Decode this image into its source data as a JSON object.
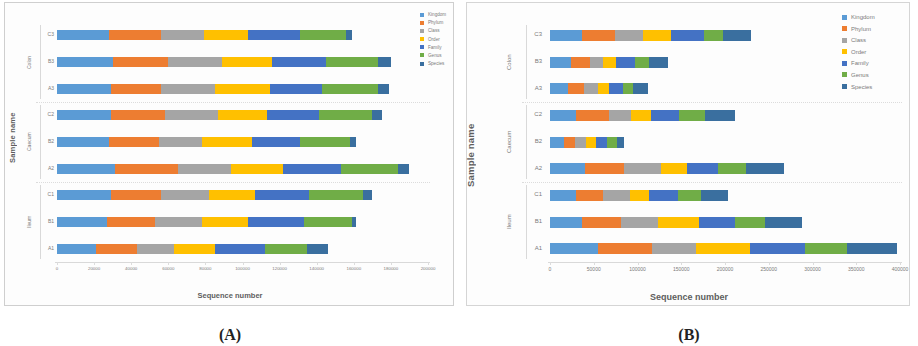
{
  "figure": {
    "panels": [
      {
        "key": "A",
        "caption": "(A)"
      },
      {
        "key": "B",
        "caption": "(B)"
      }
    ]
  },
  "series_colors": {
    "Kingdom": "#5b9bd5",
    "Phylum": "#ed7d31",
    "Class": "#a5a5a5",
    "Order": "#ffc000",
    "Family": "#4472c4",
    "Genus": "#70ad47",
    "Species": "#3a6f9f"
  },
  "legend": {
    "position": "right",
    "entries": [
      "Kingdom",
      "Phylum",
      "Class",
      "Order",
      "Family",
      "Genus",
      "Species"
    ]
  },
  "axis_titles": {
    "x": "Sequence number",
    "y": "Sample name"
  },
  "groups": [
    "Colon",
    "Caecum",
    "Ileum"
  ],
  "chart_data": [
    {
      "panel": "A",
      "caption": "(A)",
      "type": "bar",
      "orientation": "horizontal",
      "stacked": true,
      "title": "",
      "xlabel": "Sequence number",
      "ylabel": "Sample name",
      "xlim": [
        0,
        200000
      ],
      "xticks": [
        0,
        20000,
        40000,
        60000,
        80000,
        100000,
        120000,
        140000,
        160000,
        180000,
        200000
      ],
      "xticklabels": [
        "0",
        "20000",
        "40000",
        "60000",
        "80000",
        "100000",
        "120000",
        "140000",
        "160000",
        "180000",
        "200000"
      ],
      "grid": false,
      "legend_position": "right",
      "group_labels": [
        "Colon",
        "Caecum",
        "Ileum"
      ],
      "categories": [
        "C3",
        "B3",
        "A3",
        "C2",
        "B2",
        "A2",
        "C1",
        "B1",
        "A1"
      ],
      "category_groups": [
        "Colon",
        "Colon",
        "Colon",
        "Caecum",
        "Caecum",
        "Caecum",
        "Ileum",
        "Ileum",
        "Ileum"
      ],
      "series": [
        {
          "name": "Kingdom",
          "values": [
            28000,
            30000,
            29000,
            29000,
            28000,
            31000,
            29000,
            27000,
            21000
          ]
        },
        {
          "name": "Phylum",
          "values": [
            28000,
            30000,
            27000,
            29000,
            27000,
            34000,
            27000,
            26000,
            22000
          ]
        },
        {
          "name": "Class",
          "values": [
            23000,
            29000,
            29000,
            29000,
            23000,
            29000,
            26000,
            25000,
            20000
          ]
        },
        {
          "name": "Order",
          "values": [
            24000,
            27000,
            30000,
            26000,
            27000,
            28000,
            25000,
            25000,
            22000
          ]
        },
        {
          "name": "Family",
          "values": [
            28000,
            29000,
            28000,
            28000,
            26000,
            31000,
            29000,
            30000,
            27000
          ]
        },
        {
          "name": "Genus",
          "values": [
            25000,
            28000,
            30000,
            29000,
            27000,
            31000,
            29000,
            26000,
            23000
          ]
        },
        {
          "name": "Species",
          "values": [
            3000,
            7000,
            6000,
            5000,
            3000,
            6000,
            5000,
            2000,
            11000
          ]
        }
      ],
      "totals": [
        159000,
        180000,
        179000,
        175000,
        161000,
        190000,
        170000,
        161000,
        146000
      ]
    },
    {
      "panel": "B",
      "caption": "(B)",
      "type": "bar",
      "orientation": "horizontal",
      "stacked": true,
      "title": "",
      "xlabel": "Sequence number",
      "ylabel": "Sample name",
      "xlim": [
        0,
        400000
      ],
      "xticks": [
        0,
        50000,
        100000,
        150000,
        200000,
        250000,
        300000,
        350000,
        400000
      ],
      "xticklabels": [
        "0",
        "50000",
        "100000",
        "150000",
        "200000",
        "250000",
        "300000",
        "350000",
        "400000"
      ],
      "grid": false,
      "legend_position": "right",
      "group_labels": [
        "Colon",
        "Caecum",
        "Ileum"
      ],
      "categories": [
        "C3",
        "B3",
        "A3",
        "C2",
        "B2",
        "A2",
        "C1",
        "B1",
        "A1"
      ],
      "category_groups": [
        "Colon",
        "Colon",
        "Colon",
        "Caecum",
        "Caecum",
        "Caecum",
        "Ileum",
        "Ileum",
        "Ileum"
      ],
      "series": [
        {
          "name": "Kingdom",
          "values": [
            37000,
            24000,
            20000,
            30000,
            16000,
            40000,
            30000,
            37000,
            55000
          ]
        },
        {
          "name": "Phylum",
          "values": [
            37000,
            22000,
            19000,
            37000,
            13000,
            45000,
            31000,
            44000,
            62000
          ]
        },
        {
          "name": "Class",
          "values": [
            32000,
            15000,
            16000,
            26000,
            12000,
            42000,
            30000,
            42000,
            50000
          ]
        },
        {
          "name": "Order",
          "values": [
            32000,
            14000,
            12000,
            22000,
            11000,
            30000,
            22000,
            47000,
            62000
          ]
        },
        {
          "name": "Family",
          "values": [
            38000,
            22000,
            17000,
            32000,
            13000,
            35000,
            33000,
            41000,
            62000
          ]
        },
        {
          "name": "Genus",
          "values": [
            22000,
            16000,
            11000,
            30000,
            11000,
            32000,
            27000,
            35000,
            48000
          ]
        },
        {
          "name": "Species",
          "values": [
            32000,
            22000,
            17000,
            35000,
            9000,
            44000,
            30000,
            42000,
            58000
          ]
        }
      ],
      "totals": [
        230000,
        135000,
        112000,
        212000,
        85000,
        268000,
        203000,
        288000,
        397000
      ]
    }
  ]
}
